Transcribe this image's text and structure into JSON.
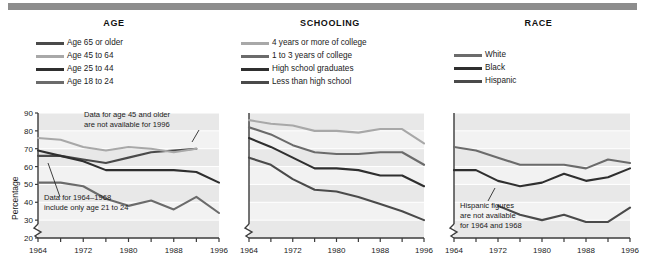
{
  "figure": {
    "top_rule_color": "#8d8d8d",
    "band_color": "#e8e8e8",
    "plot_bg": "#f2f2f2",
    "axis_color": "#3a3a3a"
  },
  "panels": [
    {
      "id": "age",
      "title": "AGE",
      "ylabel": "Percentage",
      "legend": [
        {
          "label": "Age 65 or older",
          "color": "#4a4a4a"
        },
        {
          "label": "Age 45 to 64",
          "color": "#a8a8a8"
        },
        {
          "label": "Age 25 to 44",
          "color": "#2f2f2f"
        },
        {
          "label": "Age 18 to 24",
          "color": "#6b6b6b"
        }
      ],
      "annotations": [
        {
          "name": "age-45-note",
          "lines": [
            "Data for age 45 and older",
            "are not available for 1996"
          ]
        },
        {
          "name": "age-1964-1968-note",
          "lines": [
            "Data for 1964–1968",
            "include only age 21 to 24"
          ]
        }
      ]
    },
    {
      "id": "schooling",
      "title": "SCHOOLING",
      "ylabel": "",
      "legend": [
        {
          "label": "4 years or more of college",
          "color": "#a8a8a8"
        },
        {
          "label": "1 to 3 years of college",
          "color": "#6b6b6b"
        },
        {
          "label": "High school graduates",
          "color": "#2f2f2f"
        },
        {
          "label": "Less than high school",
          "color": "#4a4a4a"
        }
      ],
      "annotations": []
    },
    {
      "id": "race",
      "title": "RACE",
      "ylabel": "",
      "legend": [
        {
          "label": "White",
          "color": "#6b6b6b"
        },
        {
          "label": "Black",
          "color": "#2f2f2f"
        },
        {
          "label": "Hispanic",
          "color": "#4a4a4a"
        }
      ],
      "annotations": [
        {
          "name": "hispanic-note",
          "lines": [
            "Hispanic figures",
            "are not available",
            "for 1964 and 1968"
          ]
        }
      ]
    }
  ],
  "chart_data": [
    {
      "type": "line",
      "title": "AGE",
      "xlabel": "",
      "ylabel": "Percentage",
      "ylim": [
        20,
        90
      ],
      "yticks": [
        20,
        30,
        40,
        50,
        60,
        70,
        80,
        90
      ],
      "ytick_labels": [
        "20",
        "30",
        "40",
        "50",
        "60",
        "70",
        "80",
        "90"
      ],
      "axis_break_y": true,
      "grid": true,
      "legend_position": "above-plot",
      "x": [
        1964,
        1968,
        1972,
        1976,
        1980,
        1984,
        1988,
        1992,
        1996
      ],
      "xticks": [
        1964,
        1968,
        1972,
        1976,
        1980,
        1984,
        1988,
        1992,
        1996
      ],
      "xtick_labels": [
        "1964",
        "",
        "1972",
        "",
        "1980",
        "",
        "1988",
        "",
        "1996"
      ],
      "series": [
        {
          "name": "Age 65 or older",
          "color": "#4a4a4a",
          "values": [
            66,
            66,
            64,
            62,
            65,
            68,
            69,
            70,
            null
          ]
        },
        {
          "name": "Age 45 to 64",
          "color": "#a8a8a8",
          "values": [
            76,
            75,
            71,
            69,
            71,
            70,
            68,
            70,
            null
          ]
        },
        {
          "name": "Age 25 to 44",
          "color": "#2f2f2f",
          "values": [
            69,
            66,
            63,
            58,
            58,
            58,
            58,
            57,
            51
          ]
        },
        {
          "name": "Age 18 to 24",
          "color": "#6b6b6b",
          "values": [
            51,
            51,
            49,
            42,
            38,
            41,
            36,
            43,
            34
          ]
        }
      ],
      "notes": [
        "Data for age 45 and older are not available for 1996",
        "Data for 1964–1968 include only age 21 to 24"
      ]
    },
    {
      "type": "line",
      "title": "SCHOOLING",
      "xlabel": "",
      "ylabel": "",
      "ylim": [
        20,
        90
      ],
      "yticks": [
        20,
        30,
        40,
        50,
        60,
        70,
        80,
        90
      ],
      "ytick_labels": [],
      "axis_break_y": true,
      "grid": true,
      "legend_position": "above-plot",
      "x": [
        1964,
        1968,
        1972,
        1976,
        1980,
        1984,
        1988,
        1992,
        1996
      ],
      "xticks": [
        1964,
        1968,
        1972,
        1976,
        1980,
        1984,
        1988,
        1992,
        1996
      ],
      "xtick_labels": [
        "1964",
        "",
        "1972",
        "",
        "1980",
        "",
        "1988",
        "",
        "1996"
      ],
      "series": [
        {
          "name": "4 years or more of college",
          "color": "#a8a8a8",
          "values": [
            86,
            84,
            83,
            80,
            80,
            79,
            81,
            81,
            73
          ]
        },
        {
          "name": "1 to 3 years of college",
          "color": "#6b6b6b",
          "values": [
            82,
            78,
            72,
            68,
            67,
            67,
            68,
            68,
            61
          ]
        },
        {
          "name": "High school graduates",
          "color": "#2f2f2f",
          "values": [
            76,
            71,
            65,
            59,
            59,
            58,
            55,
            55,
            49
          ]
        },
        {
          "name": "Less than high school",
          "color": "#4a4a4a",
          "values": [
            65,
            61,
            53,
            47,
            46,
            43,
            39,
            35,
            30
          ]
        }
      ],
      "notes": []
    },
    {
      "type": "line",
      "title": "RACE",
      "xlabel": "",
      "ylabel": "",
      "ylim": [
        20,
        90
      ],
      "yticks": [
        20,
        30,
        40,
        50,
        60,
        70,
        80,
        90
      ],
      "ytick_labels": [],
      "axis_break_y": true,
      "grid": true,
      "legend_position": "above-plot",
      "x": [
        1964,
        1968,
        1972,
        1976,
        1980,
        1984,
        1988,
        1992,
        1996
      ],
      "xticks": [
        1964,
        1968,
        1972,
        1976,
        1980,
        1984,
        1988,
        1992,
        1996
      ],
      "xtick_labels": [
        "1964",
        "",
        "1972",
        "",
        "1980",
        "",
        "1988",
        "",
        "1996"
      ],
      "series": [
        {
          "name": "White",
          "color": "#6b6b6b",
          "values": [
            71,
            69,
            65,
            61,
            61,
            61,
            59,
            64,
            62
          ]
        },
        {
          "name": "Black",
          "color": "#2f2f2f",
          "values": [
            58,
            58,
            52,
            49,
            51,
            56,
            52,
            54,
            59
          ]
        },
        {
          "name": "Hispanic",
          "color": "#4a4a4a",
          "values": [
            null,
            null,
            38,
            33,
            30,
            33,
            29,
            29,
            37
          ]
        }
      ],
      "notes": [
        "Hispanic figures are not available for 1964 and 1968"
      ]
    }
  ]
}
